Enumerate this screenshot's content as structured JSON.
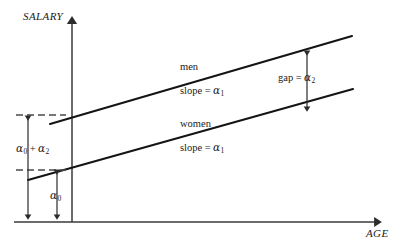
{
  "figure": {
    "axes": {
      "y_label": "SALARY",
      "x_label": "AGE"
    },
    "series": [
      {
        "name": "men",
        "label": "men",
        "slope_label": "slope",
        "slope_symbol": "α",
        "slope_subscript": "1",
        "equals": "="
      },
      {
        "name": "women",
        "label": "women",
        "slope_label": "slope",
        "slope_symbol": "α",
        "slope_subscript": "1",
        "equals": "="
      }
    ],
    "annotations": {
      "gap": {
        "label": "gap",
        "equals": "=",
        "symbol": "α",
        "subscript": "2"
      },
      "intercept_sum": {
        "symbol_first": "α",
        "subscript_first": "0",
        "operator": "+",
        "symbol_second": "α",
        "subscript_second": "2"
      },
      "intercept_base": {
        "symbol": "α",
        "subscript": "0"
      }
    },
    "colors": {
      "line": "#1a1a1a",
      "axis": "#3a3a3a",
      "dashed": "#4a4a4a",
      "background": "#ffffff"
    }
  }
}
